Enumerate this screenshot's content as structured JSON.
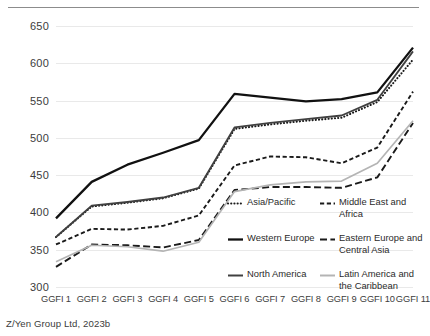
{
  "caption": "Z/Yen Group Ltd, 2023b",
  "chart_data": {
    "type": "line",
    "title": "",
    "xlabel": "",
    "ylabel": "",
    "ylim": [
      300,
      650
    ],
    "yticks": [
      300,
      350,
      400,
      450,
      500,
      550,
      600,
      650
    ],
    "grid": true,
    "legend_position": "bottom-right-inside",
    "categories": [
      "GGFI 1",
      "GGFI 2",
      "GGFI 3",
      "GGFI 4",
      "GGFI 5",
      "GGFI 6",
      "GGFI 7",
      "GGFI 8",
      "GGFI 9",
      "GGFI 10",
      "GGFI 11"
    ],
    "series": [
      {
        "name": "Asia/Pacific",
        "style": "dotted",
        "color": "#1a1a1a",
        "values": [
          367,
          408,
          413,
          419,
          432,
          512,
          518,
          523,
          527,
          548,
          605
        ]
      },
      {
        "name": "Middle East and Africa",
        "style": "short-dash",
        "color": "#1a1a1a",
        "values": [
          357,
          378,
          377,
          382,
          396,
          463,
          475,
          474,
          466,
          487,
          562
        ]
      },
      {
        "name": "Western Europe",
        "style": "solid-thick",
        "color": "#111111",
        "values": [
          392,
          441,
          464,
          480,
          497,
          559,
          554,
          549,
          552,
          561,
          621
        ]
      },
      {
        "name": "Eastern Europe and Central Asia",
        "style": "dash",
        "color": "#1a1a1a",
        "values": [
          327,
          357,
          356,
          353,
          363,
          430,
          434,
          434,
          433,
          447,
          520
        ]
      },
      {
        "name": "North America",
        "style": "solid",
        "color": "#404040",
        "values": [
          367,
          409,
          414,
          420,
          433,
          514,
          520,
          525,
          530,
          551,
          616
        ]
      },
      {
        "name": "Latin America and the Caribbean",
        "style": "solid-light",
        "color": "#b4b4b4",
        "values": [
          334,
          356,
          354,
          348,
          360,
          428,
          437,
          441,
          442,
          466,
          523
        ]
      }
    ]
  },
  "legend": {
    "rows": [
      [
        {
          "label": "Asia/Pacific",
          "key": "dotted-line-key"
        },
        {
          "label": "Middle East and Africa",
          "key": "short-dash-line-key"
        }
      ],
      [
        {
          "label": "Western Europe",
          "key": "solid-thick-line-key"
        },
        {
          "label": "Eastern Europe and Central Asia",
          "key": "dash-line-key"
        }
      ],
      [
        {
          "label": "North America",
          "key": "solid-line-key"
        },
        {
          "label": "Latin America and the Caribbean",
          "key": "solid-light-line-key"
        }
      ]
    ]
  }
}
